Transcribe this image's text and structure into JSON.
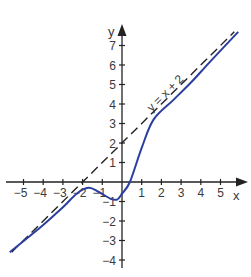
{
  "chart_data": {
    "type": "line",
    "title": "",
    "xlabel": "x",
    "ylabel": "y",
    "xlim": [
      -5.8,
      6.2
    ],
    "ylim": [
      -4.3,
      8.0
    ],
    "grid": false,
    "x_ticks": [
      -5,
      -4,
      -3,
      -2,
      -1,
      1,
      2,
      3,
      4,
      5
    ],
    "y_ticks": [
      -4,
      -3,
      -2,
      -1,
      1,
      2,
      3,
      4,
      5,
      6,
      7
    ],
    "x_tick_labels": [
      "−5",
      "−4",
      "−3",
      "−2",
      "−1",
      "1",
      "2",
      "3",
      "4",
      "5"
    ],
    "y_tick_labels": [
      "−4",
      "−3",
      "−2",
      "−1",
      "1",
      "2",
      "3",
      "4",
      "5",
      "6",
      "7"
    ],
    "series": [
      {
        "name": "f(x)",
        "style": "solid",
        "color": "#2b3f9e",
        "x": [
          -5.7,
          -4.0,
          -3.0,
          -2.3,
          -1.7,
          -1.2,
          -0.6,
          -0.25,
          0.0,
          0.4,
          1.0,
          1.6,
          2.6,
          3.5,
          4.5,
          5.9
        ],
        "y": [
          -3.6,
          -2.2,
          -1.3,
          -0.6,
          -0.3,
          -0.5,
          -0.85,
          -0.9,
          -0.6,
          0.0,
          1.75,
          3.2,
          4.2,
          5.1,
          6.2,
          7.7
        ]
      },
      {
        "name": "y = x + 2",
        "style": "dashed",
        "color": "#222222",
        "x": [
          -5.6,
          5.7
        ],
        "y": [
          -3.6,
          7.7
        ]
      }
    ],
    "annotations": [
      {
        "text": "y = x + 2",
        "x": 2.2,
        "y": 4.7,
        "rotation": -45
      }
    ]
  },
  "labels": {
    "x_axis": "x",
    "y_axis": "y",
    "asymptote": "y = x + 2"
  }
}
